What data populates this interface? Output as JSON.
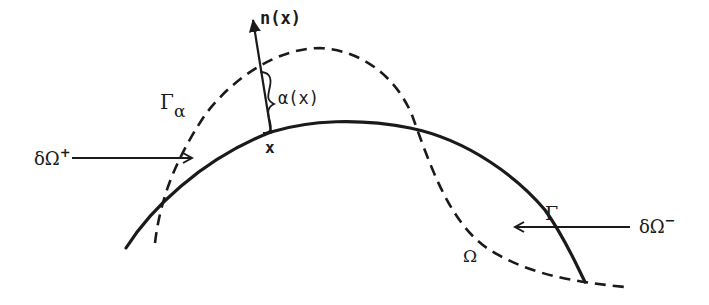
{
  "diagram": {
    "type": "boundary-perturbation-sketch",
    "colors": {
      "stroke": "#1a1a1a",
      "background": "#ffffff"
    },
    "labels": {
      "normal": "n(x)",
      "alpha": "α(x)",
      "point": "x",
      "gamma_alpha_main": "Γ",
      "gamma_alpha_sub": "α",
      "gamma": "Γ",
      "omega": "Ω",
      "delta_omega_plus_main": "δΩ",
      "delta_omega_plus_sup": "+",
      "delta_omega_minus_main": "δΩ",
      "delta_omega_minus_sup": "−"
    },
    "curves": [
      {
        "name": "Γ",
        "style": "solid",
        "description": "original boundary"
      },
      {
        "name": "Γα",
        "style": "dashed",
        "description": "perturbed boundary"
      }
    ],
    "arrows": [
      {
        "name": "normal n(x)",
        "from": "x",
        "direction": "up-left"
      },
      {
        "name": "δΩ+",
        "direction": "right"
      },
      {
        "name": "δΩ−",
        "direction": "left"
      }
    ]
  }
}
